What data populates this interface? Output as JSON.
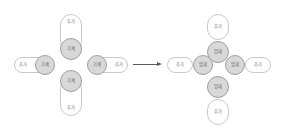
{
  "diagram": {
    "colors": {
      "background": "#ffffff",
      "pill_fill": "#ffffff",
      "pill_stroke": "#c9c9c9",
      "circle_fill": "#d8d8d8",
      "circle_stroke": "#9f9f9f",
      "text": "#6e6e6e",
      "arrow": "#5a5a5a"
    },
    "arrow": {
      "direction": "right",
      "label": ""
    },
    "left_group": {
      "name": "merged-state",
      "nodes": [
        {
          "id": "L-top-pill",
          "label": "추가",
          "shape": "pill-vertical"
        },
        {
          "id": "L-top-circle",
          "label": "기계",
          "shape": "circle"
        },
        {
          "id": "L-left-pill",
          "label": "추가",
          "shape": "pill-horizontal"
        },
        {
          "id": "L-left-circle",
          "label": "기계",
          "shape": "circle"
        },
        {
          "id": "L-right-circle",
          "label": "기계",
          "shape": "circle"
        },
        {
          "id": "L-right-pill",
          "label": "추가",
          "shape": "pill-horizontal"
        },
        {
          "id": "L-bottom-circle",
          "label": "기계",
          "shape": "circle"
        },
        {
          "id": "L-bottom-pill",
          "label": "추가",
          "shape": "pill-vertical"
        }
      ]
    },
    "right_group": {
      "name": "split-state",
      "nodes": [
        {
          "id": "R-top-pill",
          "label": "추가",
          "shape": "pill-vertical"
        },
        {
          "id": "R-top-circle",
          "label": "업데",
          "shape": "circle"
        },
        {
          "id": "R-left-pill",
          "label": "추가",
          "shape": "pill-horizontal"
        },
        {
          "id": "R-left-circle",
          "label": "업데",
          "shape": "circle"
        },
        {
          "id": "R-right-circle",
          "label": "업데",
          "shape": "circle"
        },
        {
          "id": "R-right-pill",
          "label": "추가",
          "shape": "pill-horizontal"
        },
        {
          "id": "R-bottom-circle",
          "label": "업데",
          "shape": "circle"
        },
        {
          "id": "R-bottom-pill",
          "label": "추가",
          "shape": "pill-vertical"
        }
      ]
    }
  }
}
